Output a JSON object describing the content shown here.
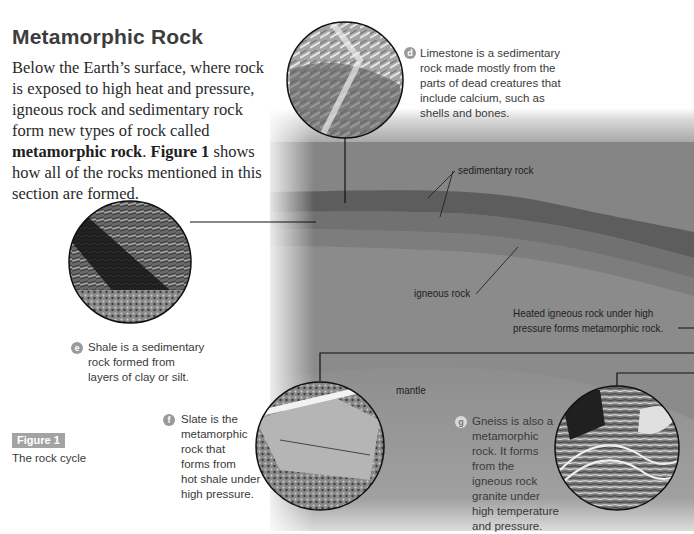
{
  "section": {
    "title": "Metamorphic Rock",
    "body_parts": [
      "Below the Earth’s surface, where rock is exposed to high heat and pressure, igneous rock and sedimentary rock form new types of rock called ",
      "metamorphic rock",
      ". ",
      "Figure 1",
      " shows how all of the rocks mentioned in this section are formed."
    ]
  },
  "figure": {
    "tag": "Figure 1",
    "caption": "The rock cycle",
    "labels": {
      "sedimentary": "sedimentary rock",
      "igneous": "igneous rock",
      "heated": "Heated igneous rock under high pressure forms metamorphic rock.",
      "heated_line1": "Heated igneous rock under high",
      "heated_line2": "pressure forms metamorphic rock.",
      "mantle": "mantle"
    },
    "callouts": [
      {
        "letter": "d",
        "rock": "limestone",
        "lines": [
          "Limestone is a sedimentary",
          "rock made mostly from the",
          "parts of dead creatures that",
          "include calcium, such as",
          "shells and bones."
        ]
      },
      {
        "letter": "e",
        "rock": "shale",
        "lines": [
          "Shale is a sedimentary",
          "rock formed from",
          "layers of clay or silt."
        ]
      },
      {
        "letter": "f",
        "rock": "slate",
        "lines": [
          "Slate is the",
          "metamorphic",
          "rock that",
          "forms from",
          "hot shale under",
          "high pressure."
        ]
      },
      {
        "letter": "g",
        "rock": "gneiss",
        "lines": [
          "Gneiss is also a",
          "metamorphic",
          "rock. It forms",
          "from the",
          "igneous rock",
          "granite under",
          "high temperature",
          "and pressure."
        ]
      }
    ]
  },
  "colors": {
    "badge": "#9a9a9a",
    "figure_tag": "#a3a3a3",
    "sky": "#b9b9b9",
    "crust": "#808080",
    "sediment_dark": "#5e5e5e",
    "sediment_mid": "#747474",
    "igneous_band": "#858585",
    "deep": "#8c8c8c",
    "mantle": "#939393"
  }
}
